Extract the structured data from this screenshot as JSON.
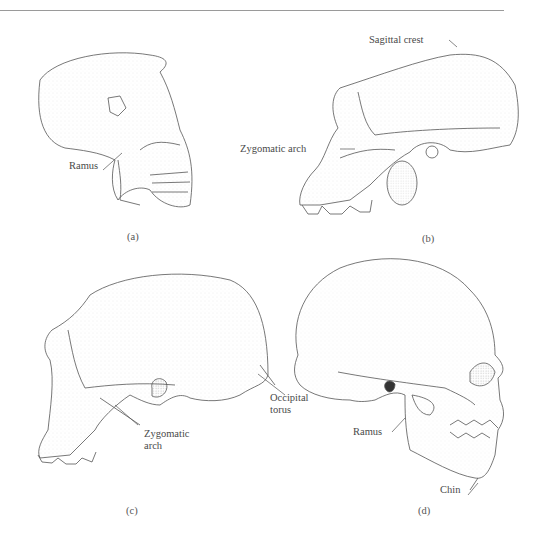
{
  "figure": {
    "panels": [
      {
        "id": "a",
        "caption": "(a)",
        "labels": [
          "Ramus"
        ]
      },
      {
        "id": "b",
        "caption": "(b)",
        "labels": [
          "Sagittal crest",
          "Zygomatic arch"
        ]
      },
      {
        "id": "c",
        "caption": "(c)",
        "labels": [
          "Occipital torus",
          "Zygomatic arch"
        ],
        "label_lines": {
          "occipital": [
            "Occipital",
            "torus"
          ],
          "zygomatic": [
            "Zygomatic",
            "arch"
          ]
        }
      },
      {
        "id": "d",
        "caption": "(d)",
        "labels": [
          "Ramus",
          "Chin"
        ]
      }
    ]
  },
  "colors": {
    "line": "#555555",
    "stipple": "#8a8a8a",
    "rule": "#9a9a9a",
    "background": "#ffffff"
  }
}
